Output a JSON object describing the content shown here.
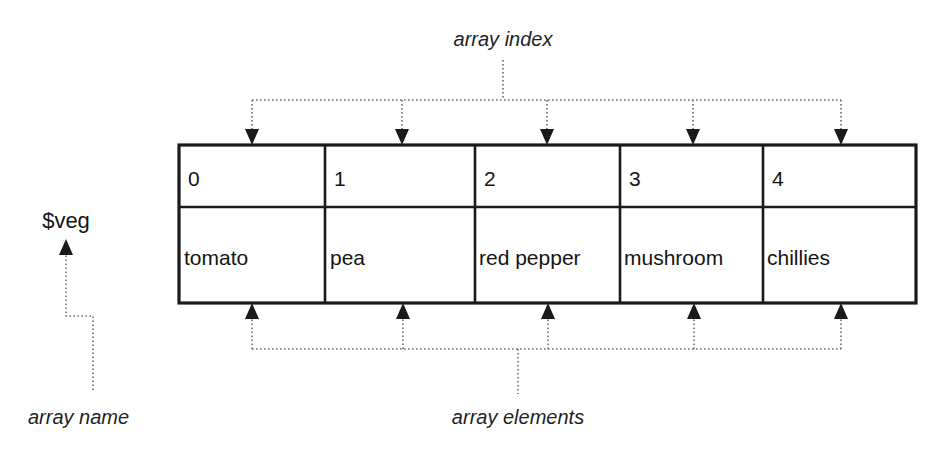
{
  "diagram": {
    "title_text_top": "array index",
    "title_text_bottom": "array elements",
    "variable_label": "$veg",
    "variable_annotation": "array name",
    "table": {
      "index_row_label": "index",
      "value_row_label": "value",
      "columns": [
        {
          "index": "0",
          "value": "tomato"
        },
        {
          "index": "1",
          "value": "pea"
        },
        {
          "index": "2",
          "value": "red pepper"
        },
        {
          "index": "3",
          "value": "mushroom"
        },
        {
          "index": "4",
          "value": "chillies"
        }
      ]
    },
    "colors": {
      "table_stroke": "#1a1a1a",
      "dotted_stroke": "#6f6f6f",
      "text": "#141414",
      "background": "#ffffff"
    }
  }
}
